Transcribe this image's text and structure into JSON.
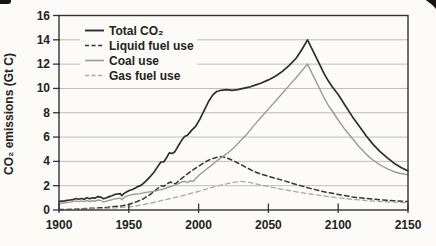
{
  "chart_data": {
    "type": "line",
    "title": "",
    "xlabel": "",
    "ylabel": "CO₂ emissions (Gt C)",
    "xlim": [
      1900,
      2150
    ],
    "ylim": [
      0,
      16
    ],
    "x_ticks": [
      1900,
      1950,
      2000,
      2050,
      2100,
      2150
    ],
    "y_ticks": [
      0,
      2,
      4,
      6,
      8,
      10,
      12,
      14,
      16
    ],
    "grid": true,
    "legend_position": "top-left",
    "colors": {
      "grid": "#bdbdbd",
      "axis": "#333333",
      "text": "#232323",
      "background": "#fcfbf8",
      "dark_series": "#2e2e2e",
      "gray_series": "#9b9b9b"
    },
    "series": [
      {
        "name": "Total CO₂",
        "style": "solid",
        "color": "#2e2e2e",
        "width": 1.7,
        "points": [
          [
            1900,
            0.68
          ],
          [
            1902,
            0.72
          ],
          [
            1904,
            0.75
          ],
          [
            1906,
            0.8
          ],
          [
            1908,
            0.82
          ],
          [
            1910,
            0.85
          ],
          [
            1912,
            0.95
          ],
          [
            1914,
            0.88
          ],
          [
            1916,
            0.95
          ],
          [
            1918,
            0.88
          ],
          [
            1920,
            1.0
          ],
          [
            1922,
            0.92
          ],
          [
            1924,
            1.0
          ],
          [
            1926,
            0.98
          ],
          [
            1928,
            1.1
          ],
          [
            1930,
            1.05
          ],
          [
            1932,
            0.92
          ],
          [
            1934,
            1.0
          ],
          [
            1936,
            1.1
          ],
          [
            1938,
            1.18
          ],
          [
            1940,
            1.28
          ],
          [
            1942,
            1.32
          ],
          [
            1944,
            1.35
          ],
          [
            1945,
            1.18
          ],
          [
            1947,
            1.4
          ],
          [
            1950,
            1.58
          ],
          [
            1953,
            1.7
          ],
          [
            1956,
            1.9
          ],
          [
            1959,
            2.05
          ],
          [
            1962,
            2.35
          ],
          [
            1965,
            2.7
          ],
          [
            1968,
            3.1
          ],
          [
            1970,
            3.45
          ],
          [
            1973,
            3.95
          ],
          [
            1975,
            3.95
          ],
          [
            1977,
            4.3
          ],
          [
            1979,
            4.7
          ],
          [
            1981,
            4.65
          ],
          [
            1983,
            4.8
          ],
          [
            1985,
            5.2
          ],
          [
            1988,
            5.75
          ],
          [
            1990,
            6.05
          ],
          [
            1992,
            6.15
          ],
          [
            1995,
            6.55
          ],
          [
            1998,
            6.9
          ],
          [
            2001,
            7.5
          ],
          [
            2004,
            8.2
          ],
          [
            2007,
            8.9
          ],
          [
            2010,
            9.45
          ],
          [
            2013,
            9.75
          ],
          [
            2016,
            9.85
          ],
          [
            2020,
            9.9
          ],
          [
            2024,
            9.85
          ],
          [
            2028,
            9.9
          ],
          [
            2032,
            10.0
          ],
          [
            2036,
            10.1
          ],
          [
            2040,
            10.25
          ],
          [
            2045,
            10.45
          ],
          [
            2050,
            10.7
          ],
          [
            2055,
            11.0
          ],
          [
            2060,
            11.4
          ],
          [
            2065,
            11.9
          ],
          [
            2070,
            12.5
          ],
          [
            2074,
            13.2
          ],
          [
            2078,
            14.0
          ],
          [
            2081,
            13.3
          ],
          [
            2084,
            12.6
          ],
          [
            2087,
            11.9
          ],
          [
            2090,
            11.2
          ],
          [
            2093,
            10.6
          ],
          [
            2096,
            10.1
          ],
          [
            2100,
            9.5
          ],
          [
            2105,
            8.6
          ],
          [
            2110,
            7.7
          ],
          [
            2115,
            6.9
          ],
          [
            2120,
            6.1
          ],
          [
            2125,
            5.4
          ],
          [
            2130,
            4.8
          ],
          [
            2135,
            4.3
          ],
          [
            2140,
            3.85
          ],
          [
            2145,
            3.5
          ],
          [
            2150,
            3.2
          ]
        ]
      },
      {
        "name": "Liquid fuel use",
        "style": "dashed",
        "color": "#343434",
        "width": 1.5,
        "points": [
          [
            1900,
            0.03
          ],
          [
            1910,
            0.06
          ],
          [
            1920,
            0.12
          ],
          [
            1930,
            0.18
          ],
          [
            1935,
            0.22
          ],
          [
            1940,
            0.3
          ],
          [
            1945,
            0.33
          ],
          [
            1950,
            0.45
          ],
          [
            1955,
            0.65
          ],
          [
            1960,
            0.9
          ],
          [
            1965,
            1.25
          ],
          [
            1970,
            1.7
          ],
          [
            1973,
            2.0
          ],
          [
            1975,
            1.95
          ],
          [
            1978,
            2.2
          ],
          [
            1980,
            2.3
          ],
          [
            1982,
            2.15
          ],
          [
            1984,
            2.2
          ],
          [
            1986,
            2.45
          ],
          [
            1988,
            2.6
          ],
          [
            1990,
            2.8
          ],
          [
            1993,
            3.05
          ],
          [
            1996,
            3.3
          ],
          [
            2000,
            3.6
          ],
          [
            2004,
            3.9
          ],
          [
            2008,
            4.15
          ],
          [
            2012,
            4.3
          ],
          [
            2016,
            4.4
          ],
          [
            2020,
            4.3
          ],
          [
            2025,
            4.05
          ],
          [
            2030,
            3.75
          ],
          [
            2035,
            3.45
          ],
          [
            2040,
            3.15
          ],
          [
            2045,
            2.95
          ],
          [
            2050,
            2.78
          ],
          [
            2055,
            2.6
          ],
          [
            2060,
            2.45
          ],
          [
            2070,
            2.1
          ],
          [
            2080,
            1.78
          ],
          [
            2090,
            1.5
          ],
          [
            2100,
            1.28
          ],
          [
            2110,
            1.08
          ],
          [
            2120,
            0.95
          ],
          [
            2130,
            0.85
          ],
          [
            2140,
            0.76
          ],
          [
            2150,
            0.7
          ]
        ]
      },
      {
        "name": "Coal use",
        "style": "solid",
        "color": "#9b9b9b",
        "width": 1.4,
        "points": [
          [
            1900,
            0.52
          ],
          [
            1904,
            0.6
          ],
          [
            1908,
            0.65
          ],
          [
            1912,
            0.75
          ],
          [
            1914,
            0.68
          ],
          [
            1916,
            0.75
          ],
          [
            1918,
            0.68
          ],
          [
            1920,
            0.78
          ],
          [
            1922,
            0.7
          ],
          [
            1924,
            0.76
          ],
          [
            1926,
            0.72
          ],
          [
            1928,
            0.82
          ],
          [
            1930,
            0.78
          ],
          [
            1932,
            0.65
          ],
          [
            1934,
            0.72
          ],
          [
            1936,
            0.8
          ],
          [
            1938,
            0.85
          ],
          [
            1940,
            0.92
          ],
          [
            1942,
            0.95
          ],
          [
            1944,
            0.98
          ],
          [
            1945,
            0.85
          ],
          [
            1947,
            1.05
          ],
          [
            1950,
            1.2
          ],
          [
            1954,
            1.3
          ],
          [
            1958,
            1.35
          ],
          [
            1962,
            1.45
          ],
          [
            1966,
            1.5
          ],
          [
            1970,
            1.6
          ],
          [
            1974,
            1.7
          ],
          [
            1978,
            1.85
          ],
          [
            1982,
            2.0
          ],
          [
            1985,
            2.15
          ],
          [
            1988,
            2.3
          ],
          [
            1990,
            2.35
          ],
          [
            1992,
            2.25
          ],
          [
            1994,
            2.4
          ],
          [
            1996,
            2.35
          ],
          [
            1998,
            2.6
          ],
          [
            2000,
            2.85
          ],
          [
            2003,
            3.1
          ],
          [
            2006,
            3.4
          ],
          [
            2009,
            3.65
          ],
          [
            2012,
            3.95
          ],
          [
            2015,
            4.2
          ],
          [
            2018,
            4.45
          ],
          [
            2022,
            4.8
          ],
          [
            2026,
            5.2
          ],
          [
            2030,
            5.7
          ],
          [
            2035,
            6.3
          ],
          [
            2040,
            7.0
          ],
          [
            2045,
            7.65
          ],
          [
            2050,
            8.3
          ],
          [
            2055,
            8.95
          ],
          [
            2060,
            9.6
          ],
          [
            2065,
            10.25
          ],
          [
            2070,
            10.9
          ],
          [
            2074,
            11.45
          ],
          [
            2078,
            12.0
          ],
          [
            2081,
            11.3
          ],
          [
            2084,
            10.6
          ],
          [
            2087,
            9.9
          ],
          [
            2090,
            9.2
          ],
          [
            2093,
            8.6
          ],
          [
            2096,
            8.1
          ],
          [
            2100,
            7.4
          ],
          [
            2105,
            6.6
          ],
          [
            2110,
            5.9
          ],
          [
            2115,
            5.2
          ],
          [
            2120,
            4.6
          ],
          [
            2125,
            4.1
          ],
          [
            2130,
            3.7
          ],
          [
            2135,
            3.4
          ],
          [
            2140,
            3.15
          ],
          [
            2145,
            3.0
          ],
          [
            2150,
            2.9
          ]
        ]
      },
      {
        "name": "Gas fuel use",
        "style": "dashed",
        "color": "#a9a9a9",
        "width": 1.3,
        "points": [
          [
            1900,
            0.02
          ],
          [
            1910,
            0.04
          ],
          [
            1920,
            0.07
          ],
          [
            1930,
            0.11
          ],
          [
            1940,
            0.18
          ],
          [
            1950,
            0.25
          ],
          [
            1955,
            0.33
          ],
          [
            1960,
            0.43
          ],
          [
            1965,
            0.55
          ],
          [
            1970,
            0.68
          ],
          [
            1975,
            0.82
          ],
          [
            1980,
            0.95
          ],
          [
            1985,
            1.08
          ],
          [
            1990,
            1.22
          ],
          [
            1995,
            1.38
          ],
          [
            2000,
            1.52
          ],
          [
            2005,
            1.7
          ],
          [
            2010,
            1.87
          ],
          [
            2015,
            2.02
          ],
          [
            2020,
            2.15
          ],
          [
            2025,
            2.27
          ],
          [
            2030,
            2.35
          ],
          [
            2035,
            2.3
          ],
          [
            2040,
            2.18
          ],
          [
            2045,
            2.05
          ],
          [
            2050,
            1.93
          ],
          [
            2060,
            1.7
          ],
          [
            2070,
            1.5
          ],
          [
            2080,
            1.32
          ],
          [
            2090,
            1.15
          ],
          [
            2100,
            1.0
          ],
          [
            2110,
            0.88
          ],
          [
            2120,
            0.78
          ],
          [
            2130,
            0.7
          ],
          [
            2140,
            0.64
          ],
          [
            2150,
            0.6
          ]
        ]
      }
    ]
  }
}
